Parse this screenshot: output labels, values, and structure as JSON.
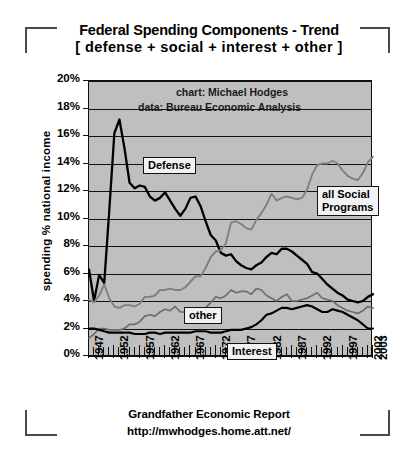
{
  "title": {
    "line1": "Federal Spending Components - Trend",
    "line2": "[ defense + social + interest + other ]"
  },
  "credits": {
    "chart": "chart: Michael Hodges",
    "data": "data: Bureau Economic Analysis"
  },
  "footer": {
    "line1": "Grandfather Economic Report",
    "line2": "http://mwhodges.home.att.net/"
  },
  "callouts": {
    "defense": "Defense",
    "social_line1": "all Social",
    "social_line2": "Programs",
    "other": "other",
    "interest": "Interest"
  },
  "colors": {
    "plot_background": "#bfbfbf",
    "axis": "#111111",
    "defense": "#000000",
    "social": "#808080",
    "other": "#6e6e6e",
    "interest": "#000000",
    "page_background": "#ffffff"
  },
  "chart_data": {
    "type": "line",
    "title": "Federal Spending Components - Trend [ defense + social + interest + other ]",
    "xlabel": "",
    "ylabel": "spending % national income",
    "xlim": [
      1947,
      2003
    ],
    "ylim": [
      0,
      20
    ],
    "ytick_labels": [
      "0%",
      "2%",
      "4%",
      "6%",
      "8%",
      "10%",
      "12%",
      "14%",
      "16%",
      "18%",
      "20%"
    ],
    "ytick_values": [
      0,
      2,
      4,
      6,
      8,
      10,
      12,
      14,
      16,
      18,
      20
    ],
    "xtick_labels": [
      "1947",
      "1952",
      "1957",
      "1962",
      "1967",
      "1972",
      "1977",
      "1982",
      "1987",
      "1992",
      "1997",
      "2002",
      "2003"
    ],
    "xtick_values": [
      1947,
      1952,
      1957,
      1962,
      1967,
      1972,
      1977,
      1982,
      1987,
      1992,
      1997,
      2002,
      2003
    ],
    "grid": "horizontal",
    "legend": "inline-callouts",
    "x": [
      1947,
      1948,
      1949,
      1950,
      1951,
      1952,
      1953,
      1954,
      1955,
      1956,
      1957,
      1958,
      1959,
      1960,
      1961,
      1962,
      1963,
      1964,
      1965,
      1966,
      1967,
      1968,
      1969,
      1970,
      1971,
      1972,
      1973,
      1974,
      1975,
      1976,
      1977,
      1978,
      1979,
      1980,
      1981,
      1982,
      1983,
      1984,
      1985,
      1986,
      1987,
      1988,
      1989,
      1990,
      1991,
      1992,
      1993,
      1994,
      1995,
      1996,
      1997,
      1998,
      1999,
      2000,
      2001,
      2002,
      2003
    ],
    "series": [
      {
        "name": "Defense",
        "color": "#000000",
        "values": [
          6.3,
          4.0,
          5.9,
          5.3,
          10.6,
          16.2,
          17.2,
          15.1,
          12.6,
          12.2,
          12.4,
          12.3,
          11.6,
          11.3,
          11.5,
          11.9,
          11.3,
          10.7,
          10.2,
          10.7,
          11.5,
          11.6,
          10.9,
          9.8,
          8.8,
          8.4,
          7.5,
          7.3,
          7.4,
          6.9,
          6.6,
          6.4,
          6.3,
          6.6,
          6.8,
          7.2,
          7.5,
          7.4,
          7.8,
          7.8,
          7.6,
          7.3,
          7.0,
          6.7,
          6.1,
          6.0,
          5.6,
          5.2,
          4.9,
          4.6,
          4.4,
          4.1,
          4.0,
          3.9,
          4.0,
          4.3,
          4.5
        ]
      },
      {
        "name": "all Social Programs",
        "color": "#808080",
        "values": [
          4.1,
          3.9,
          4.4,
          5.2,
          4.2,
          3.6,
          3.5,
          3.7,
          3.7,
          3.6,
          3.8,
          4.3,
          4.3,
          4.4,
          4.8,
          4.8,
          4.9,
          4.8,
          4.8,
          5.0,
          5.4,
          5.8,
          5.8,
          6.4,
          7.2,
          7.6,
          7.7,
          8.2,
          9.7,
          9.8,
          9.6,
          9.3,
          9.2,
          9.9,
          10.4,
          11.0,
          11.8,
          11.3,
          11.5,
          11.6,
          11.5,
          11.4,
          11.5,
          12.1,
          13.2,
          13.9,
          14.0,
          14.0,
          14.2,
          14.0,
          13.5,
          13.1,
          12.9,
          12.8,
          13.3,
          14.1,
          14.5
        ]
      },
      {
        "name": "other",
        "color": "#6e6e6e",
        "values": [
          1.3,
          1.6,
          2.0,
          2.0,
          1.9,
          1.9,
          1.9,
          2.0,
          2.3,
          2.3,
          2.5,
          2.9,
          3.0,
          2.9,
          3.2,
          3.4,
          3.3,
          3.6,
          3.2,
          3.2,
          3.4,
          3.4,
          3.3,
          3.5,
          3.9,
          4.3,
          4.2,
          4.4,
          4.8,
          4.6,
          4.7,
          4.7,
          4.5,
          4.9,
          4.8,
          4.4,
          4.2,
          4.0,
          4.3,
          4.5,
          4.0,
          4.0,
          4.1,
          4.2,
          4.4,
          4.6,
          4.2,
          4.1,
          4.0,
          3.7,
          3.5,
          3.3,
          3.2,
          3.1,
          3.3,
          3.6,
          3.5
        ]
      },
      {
        "name": "Interest",
        "color": "#000000",
        "values": [
          2.0,
          2.0,
          1.9,
          1.8,
          1.7,
          1.7,
          1.7,
          1.7,
          1.7,
          1.6,
          1.6,
          1.6,
          1.7,
          1.7,
          1.6,
          1.7,
          1.7,
          1.7,
          1.7,
          1.7,
          1.7,
          1.8,
          1.8,
          1.8,
          1.7,
          1.7,
          1.7,
          1.8,
          1.9,
          1.9,
          1.9,
          2.0,
          2.1,
          2.3,
          2.6,
          3.0,
          3.1,
          3.3,
          3.5,
          3.5,
          3.4,
          3.5,
          3.6,
          3.7,
          3.6,
          3.4,
          3.2,
          3.2,
          3.4,
          3.3,
          3.2,
          3.0,
          2.8,
          2.6,
          2.3,
          2.0,
          2.0
        ]
      }
    ]
  }
}
